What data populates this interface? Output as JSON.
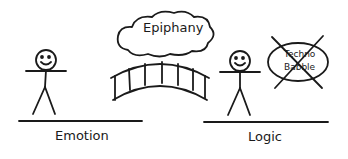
{
  "diagram": {
    "cloud_label": "Epiphany",
    "left_label": "Emotion",
    "right_label": "Logic",
    "crossed_out_line1": "Techno",
    "crossed_out_line2": "Babble"
  },
  "colors": {
    "ink": "#1a1a1a",
    "background": "#ffffff"
  }
}
